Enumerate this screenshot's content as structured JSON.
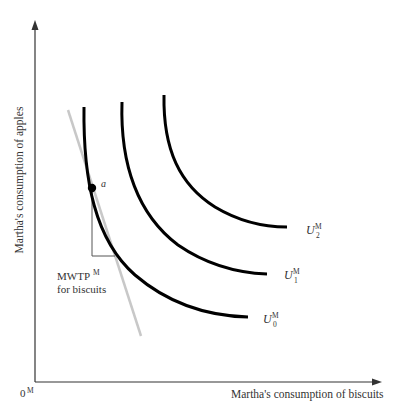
{
  "figure": {
    "y_axis_label": "Martha's consumption of apples",
    "x_axis_label": "Martha's consumption of biscuits",
    "origin_label": "0",
    "origin_superscript": "M",
    "point_label": "a",
    "mwtp_label_main": "MWTP",
    "mwtp_label_sup": "M",
    "mwtp_label_line2": "for biscuits",
    "curves": [
      {
        "name": "U",
        "superscript": "M",
        "subscript": "0"
      },
      {
        "name": "U",
        "superscript": "M",
        "subscript": "1"
      },
      {
        "name": "U",
        "superscript": "M",
        "subscript": "2"
      }
    ],
    "colors": {
      "curve": "#000000",
      "axis": "#333333",
      "tangent": "#c8c8c8",
      "bracket": "#555555"
    }
  }
}
